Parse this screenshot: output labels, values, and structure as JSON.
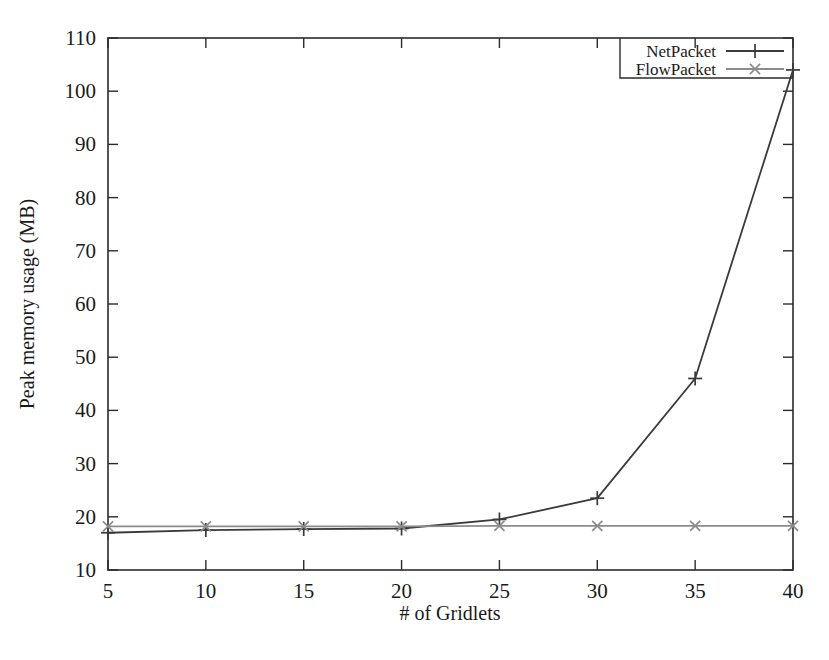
{
  "chart_data": {
    "type": "line",
    "title": "",
    "xlabel": "# of Gridlets",
    "ylabel": "Peak memory usage (MB)",
    "x": [
      5,
      10,
      15,
      20,
      25,
      30,
      35,
      40
    ],
    "xlim": [
      5,
      40
    ],
    "ylim": [
      10,
      110
    ],
    "xticks": [
      "5",
      "10",
      "15",
      "20",
      "25",
      "30",
      "35",
      "40"
    ],
    "yticks": [
      "10",
      "20",
      "30",
      "40",
      "50",
      "60",
      "70",
      "80",
      "90",
      "100",
      "110"
    ],
    "grid": false,
    "legend_position": "top-right-inside",
    "series": [
      {
        "name": "NetPacket",
        "marker": "plus",
        "color": "#3a3a3a",
        "values": [
          17.0,
          17.5,
          17.7,
          17.8,
          19.5,
          23.5,
          46.0,
          104.0
        ]
      },
      {
        "name": "FlowPacket",
        "marker": "cross",
        "color": "#8c8c8c",
        "values": [
          18.2,
          18.2,
          18.2,
          18.2,
          18.3,
          18.3,
          18.3,
          18.3
        ]
      }
    ]
  },
  "axes": {
    "x_title": "# of Gridlets",
    "y_title": "Peak memory usage (MB)"
  },
  "legend": {
    "entries": [
      {
        "label": "NetPacket"
      },
      {
        "label": "FlowPacket"
      }
    ]
  },
  "colors": {
    "series_1": "#3a3a3a",
    "series_2": "#8c8c8c",
    "frame": "#2b2b2b",
    "background": "#ffffff"
  }
}
